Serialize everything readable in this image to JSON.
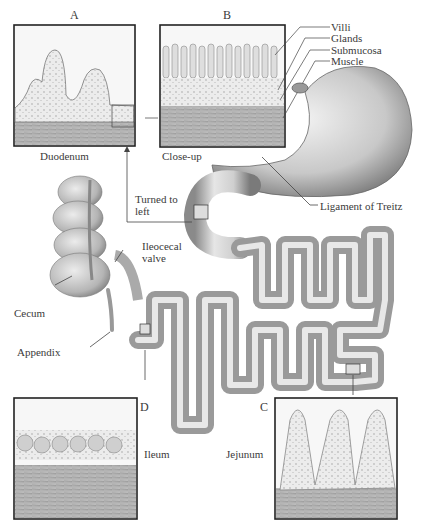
{
  "figure": {
    "panels": [
      {
        "letter": "A",
        "caption": "Duodenum"
      },
      {
        "letter": "B",
        "caption": "Close-up"
      },
      {
        "letter": "C",
        "caption": "Jejunum"
      },
      {
        "letter": "D",
        "caption": "Ileum"
      }
    ],
    "layer_labels": [
      "Villi",
      "Glands",
      "Submucosa",
      "Muscle"
    ],
    "organ_labels": {
      "turned": "Turned to left",
      "ligament": "Ligament of Treitz",
      "ileocecal": "Ileocecal valve",
      "cecum": "Cecum",
      "appendix": "Appendix"
    }
  }
}
